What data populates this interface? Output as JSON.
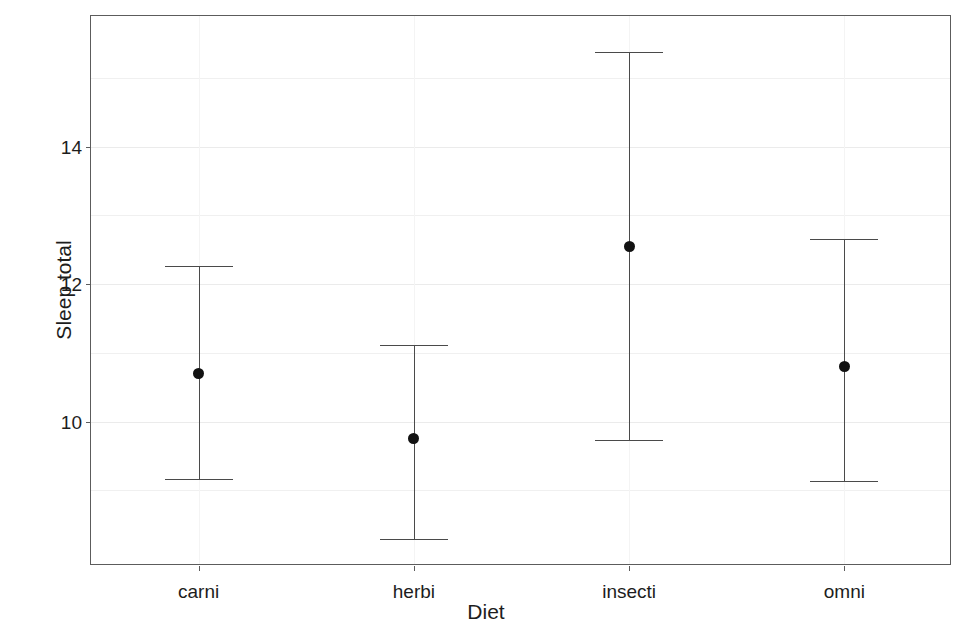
{
  "chart_data": {
    "type": "scatter",
    "title": "",
    "subtitle": "",
    "xlabel": "Diet",
    "ylabel": "Sleep total",
    "categories": [
      "carni",
      "herbi",
      "insecti",
      "omni"
    ],
    "values": [
      10.7,
      9.75,
      12.55,
      10.8
    ],
    "error_low": [
      9.17,
      8.3,
      9.73,
      9.13
    ],
    "error_high": [
      12.26,
      11.12,
      15.37,
      12.66
    ],
    "series": [
      {
        "name": "mean with error bars",
        "points": [
          {
            "category": "carni",
            "mean": 10.7,
            "lower": 9.17,
            "upper": 12.26
          },
          {
            "category": "herbi",
            "mean": 9.75,
            "lower": 8.3,
            "upper": 11.12
          },
          {
            "category": "insecti",
            "mean": 12.55,
            "lower": 9.73,
            "upper": 15.37
          },
          {
            "category": "omni",
            "mean": 10.8,
            "lower": 9.13,
            "upper": 12.66
          }
        ]
      }
    ],
    "ytick_labels": [
      "10",
      "12",
      "14"
    ],
    "ytick_values": [
      10,
      12,
      14
    ],
    "ylim": [
      7.9,
      15.9
    ],
    "xlim": [
      0.5,
      4.5
    ],
    "grid": true,
    "legend": "none",
    "point_color": "#121212",
    "errorbar_color": "#4a4a4a",
    "panel_border_color": "#5c5c5c",
    "grid_color": "#efefef",
    "background": "#ffffff"
  },
  "axes": {
    "y": {
      "title": "Sleep total",
      "ticks": [
        {
          "label": "10",
          "value": 10
        },
        {
          "label": "12",
          "value": 12
        },
        {
          "label": "14",
          "value": 14
        }
      ]
    },
    "x": {
      "title": "Diet",
      "ticks": [
        {
          "label": "carni",
          "value": 1
        },
        {
          "label": "herbi",
          "value": 2
        },
        {
          "label": "insecti",
          "value": 3
        },
        {
          "label": "omni",
          "value": 4
        }
      ]
    }
  }
}
